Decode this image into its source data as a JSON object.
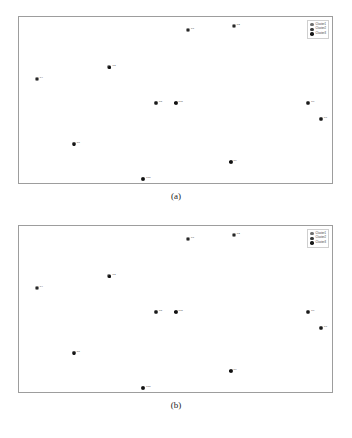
{
  "figure": {
    "caption_a": "(a)",
    "caption_b": "(b)",
    "marker_color": "#111111",
    "frame_color": "#9d9d9d",
    "background": "#ffffff"
  },
  "legend": {
    "position": "top-right",
    "items": [
      {
        "label": "Cluster1",
        "color": "#6f6f6f"
      },
      {
        "label": "Cluster2",
        "color": "#3a3a3a"
      },
      {
        "label": "Cluster3",
        "color": "#1a1a1a"
      }
    ]
  },
  "chart_data": [
    {
      "type": "scatter",
      "title": "(a)",
      "xlabel": "",
      "ylabel": "",
      "xlim": [
        0,
        100
      ],
      "ylim": [
        0,
        100
      ],
      "grid": false,
      "legend_position": "top-right",
      "series": [
        {
          "name": "Cluster1",
          "color": "#6f6f6f",
          "points": [
            {
              "label": "P1",
              "x": 54.0,
              "y": 92.3
            },
            {
              "label": "P2",
              "x": 68.6,
              "y": 94.6
            },
            {
              "label": "P3",
              "x": 28.9,
              "y": 69.6
            },
            {
              "label": "P4",
              "x": 5.7,
              "y": 62.5
            }
          ]
        },
        {
          "name": "Cluster2",
          "color": "#3a3a3a",
          "points": [
            {
              "label": "P5",
              "x": 43.8,
              "y": 48.2
            },
            {
              "label": "P6",
              "x": 92.4,
              "y": 48.2
            },
            {
              "label": "P7",
              "x": 96.5,
              "y": 38.7
            },
            {
              "label": "P8",
              "x": 17.5,
              "y": 23.2
            }
          ]
        },
        {
          "name": "Cluster3",
          "color": "#1a1a1a",
          "points": [
            {
              "label": "P9",
              "x": 67.6,
              "y": 12.5
            },
            {
              "label": "P10",
              "x": 39.7,
              "y": 2.4
            },
            {
              "label": "P11",
              "x": 50.0,
              "y": 48.2
            }
          ]
        }
      ]
    },
    {
      "type": "scatter",
      "title": "(b)",
      "xlabel": "",
      "ylabel": "",
      "xlim": [
        0,
        100
      ],
      "ylim": [
        0,
        100
      ],
      "grid": false,
      "legend_position": "top-right",
      "series": [
        {
          "name": "Cluster1",
          "color": "#6f6f6f",
          "points": [
            {
              "label": "P1",
              "x": 54.0,
              "y": 92.3
            },
            {
              "label": "P2",
              "x": 68.6,
              "y": 94.6
            },
            {
              "label": "P3",
              "x": 28.9,
              "y": 69.6
            },
            {
              "label": "P4",
              "x": 5.7,
              "y": 62.5
            }
          ]
        },
        {
          "name": "Cluster2",
          "color": "#3a3a3a",
          "points": [
            {
              "label": "P5",
              "x": 43.8,
              "y": 48.2
            },
            {
              "label": "P6",
              "x": 92.4,
              "y": 48.2
            },
            {
              "label": "P7",
              "x": 96.5,
              "y": 38.7
            },
            {
              "label": "P8",
              "x": 17.5,
              "y": 23.2
            }
          ]
        },
        {
          "name": "Cluster3",
          "color": "#1a1a1a",
          "points": [
            {
              "label": "P9",
              "x": 67.6,
              "y": 12.5
            },
            {
              "label": "P10",
              "x": 39.7,
              "y": 2.4
            },
            {
              "label": "P11",
              "x": 50.0,
              "y": 48.2
            }
          ]
        }
      ]
    }
  ]
}
